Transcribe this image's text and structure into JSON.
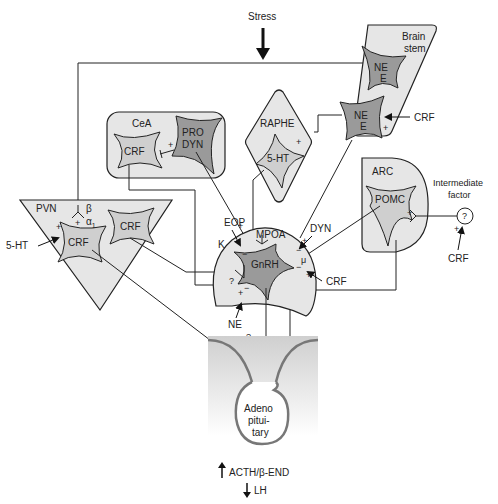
{
  "diagram": {
    "top_input": {
      "label": "Stress"
    },
    "regions": {
      "brainstem": {
        "label_line1": "Brain",
        "label_line2": "stem",
        "cells": [
          {
            "line1": "NE",
            "line2": "E"
          },
          {
            "line1": "NE",
            "line2": "E"
          }
        ],
        "input": "CRF",
        "input_sign": "+"
      },
      "cea": {
        "label": "CeA",
        "cells": [
          {
            "label": "CRF"
          },
          {
            "line1": "PRO",
            "line2": "DYN"
          }
        ],
        "synapse_sign": "+"
      },
      "raphe": {
        "label": "RAPHE",
        "cell": "5-HT",
        "synapse_sign": "+"
      },
      "pvn": {
        "label": "PVN",
        "cells": [
          {
            "label": "CRF"
          },
          {
            "label": "CRF"
          }
        ],
        "receptor_beta": "β",
        "receptor_alpha": "α",
        "receptor_alpha_sub": "1",
        "input_5ht": "5-HT",
        "plus1": "+",
        "plus2": "+"
      },
      "arc": {
        "label": "ARC",
        "cell": "POMC",
        "synapse_sign": "+"
      },
      "mpoa": {
        "label": "MPOA",
        "cell": "GnRH",
        "inputs": {
          "eop": "EOP",
          "k": "K",
          "dyn": "DYN",
          "mu": "μ",
          "crf": "CRF",
          "ne": "NE",
          "question": "?"
        },
        "signs": {
          "plus": "+",
          "minus": "−"
        }
      },
      "intermediate_factor": {
        "label_line1": "Intermediate",
        "label_line2": "factor",
        "symbol": "?",
        "input": "CRF",
        "input_sign": "+"
      },
      "pituitary": {
        "line1": "Adeno",
        "line2": "pitui-",
        "line3": "tary",
        "input": "CRF",
        "question": "?"
      }
    },
    "outputs": [
      {
        "direction": "up",
        "label": "ACTH/β-END"
      },
      {
        "direction": "down",
        "label": "LH"
      }
    ]
  }
}
